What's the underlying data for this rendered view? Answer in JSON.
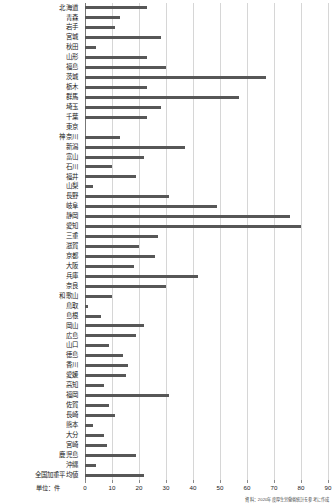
{
  "chart_data": {
    "type": "bar",
    "orientation": "horizontal",
    "title": "",
    "xlabel": "",
    "ylabel": "",
    "unit_label": "単位：件",
    "xlim": [
      0,
      90
    ],
    "xticks": [
      0,
      10,
      20,
      30,
      40,
      50,
      60,
      70,
      80,
      90
    ],
    "xtick_labels": [
      "0",
      "10",
      "20",
      "30",
      "40",
      "50",
      "60",
      "70",
      "80",
      "90"
    ],
    "grid": true,
    "legend": "none",
    "bar_color": "#575757",
    "grid_color": "#d6d6d6",
    "axis_color": "#777777",
    "categories": [
      "北海道",
      "青森",
      "岩手",
      "宮城",
      "秋田",
      "山形",
      "福島",
      "茨城",
      "栃木",
      "群馬",
      "埼玉",
      "千葉",
      "東京",
      "神奈川",
      "新潟",
      "富山",
      "石川",
      "福井",
      "山梨",
      "長野",
      "岐阜",
      "静岡",
      "愛知",
      "三重",
      "滋賀",
      "京都",
      "大阪",
      "兵庫",
      "奈良",
      "和歌山",
      "鳥取",
      "島根",
      "岡山",
      "広島",
      "山口",
      "徳島",
      "香川",
      "愛媛",
      "高知",
      "福岡",
      "佐賀",
      "長崎",
      "熊本",
      "大分",
      "宮崎",
      "鹿児島",
      "沖縄",
      "全国加重平均値"
    ],
    "values": [
      23,
      13,
      11,
      28,
      4,
      23,
      30,
      67,
      23,
      57,
      28,
      23,
      0,
      13,
      37,
      22,
      10,
      19,
      3,
      31,
      49,
      76,
      80,
      27,
      20,
      26,
      18,
      42,
      30,
      10,
      1,
      6,
      22,
      19,
      9,
      14,
      16,
      15,
      7,
      31,
      9,
      11,
      3,
      7,
      8,
      19,
      4,
      22
    ]
  },
  "source_note": "資料：2020年度厚生労働省統計を参考に作成"
}
